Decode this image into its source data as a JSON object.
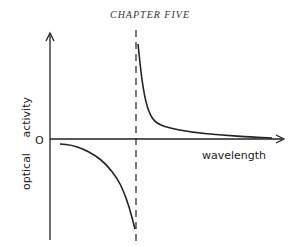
{
  "page": {
    "header": "CHAPTER FIVE"
  },
  "chart_data": {
    "type": "line",
    "title": "",
    "xlabel": "wavelength",
    "ylabel": "optical activity",
    "origin_label": "O",
    "vertical_marker": "dashed line at absorption wavelength",
    "series": [
      {
        "name": "left-branch",
        "description": "negative, decreasing toward asymptote",
        "x": [
          0.0,
          0.1,
          0.2,
          0.3,
          0.4,
          0.5,
          0.55,
          0.6,
          0.65
        ],
        "y": [
          -0.05,
          -0.06,
          -0.1,
          -0.16,
          -0.25,
          -0.4,
          -0.52,
          -0.68,
          -0.9
        ]
      },
      {
        "name": "right-branch",
        "description": "positive, decaying from asymptote toward zero",
        "x": [
          0.66,
          0.7,
          0.75,
          0.82,
          0.95,
          1.2,
          1.5,
          1.8,
          2.0
        ],
        "y": [
          1.0,
          0.6,
          0.33,
          0.18,
          0.12,
          0.07,
          0.04,
          0.02,
          0.01
        ]
      }
    ],
    "xlim": [
      0,
      2.0
    ],
    "ylim": [
      -1.0,
      1.0
    ]
  }
}
